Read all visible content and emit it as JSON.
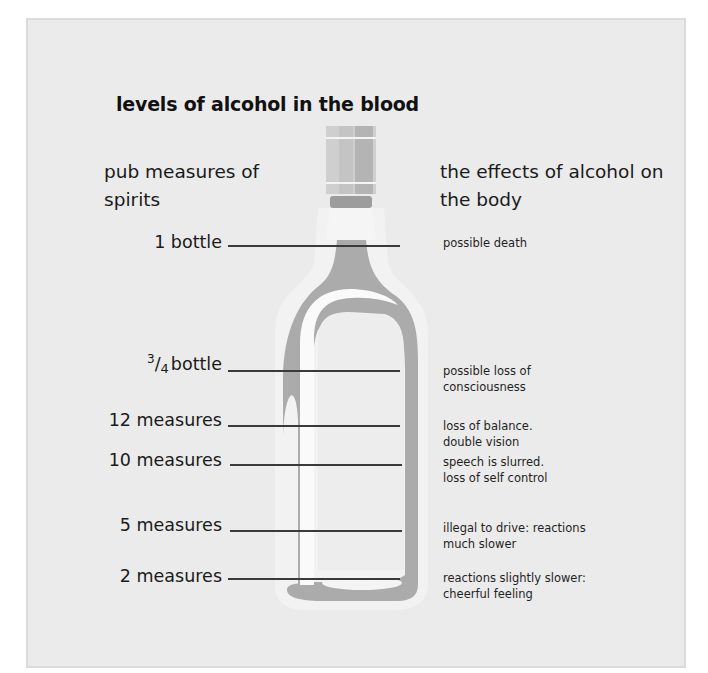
{
  "title": "levels of alcohol in the blood",
  "left_header": "pub measures of spirits",
  "right_header": "the effects of alcohol on the body",
  "colors": {
    "background": "#ebebeb",
    "bottle_grey": "#a9a9a9",
    "bottle_highlight": "#f7f7f7",
    "rule": "#3a3a3a",
    "text": "#1a1a1a"
  },
  "levels": [
    {
      "measure": "1 bottle",
      "effect_line1": "possible death",
      "effect_line2": ""
    },
    {
      "measure_fraction_num": "3",
      "measure_fraction_den": "4",
      "measure": "bottle",
      "effect_line1": "possible loss of",
      "effect_line2": "consciousness"
    },
    {
      "measure": "12 measures",
      "effect_line1": "loss of balance.",
      "effect_line2": "double vision"
    },
    {
      "measure": "10 measures",
      "effect_line1": "speech is slurred.",
      "effect_line2": "loss of self control"
    },
    {
      "measure": "5 measures",
      "effect_line1": "illegal to drive: reactions",
      "effect_line2": "much slower"
    },
    {
      "measure": "2 measures",
      "effect_line1": "reactions slightly slower:",
      "effect_line2": "cheerful feeling"
    }
  ],
  "illustration": "bottle-icon"
}
